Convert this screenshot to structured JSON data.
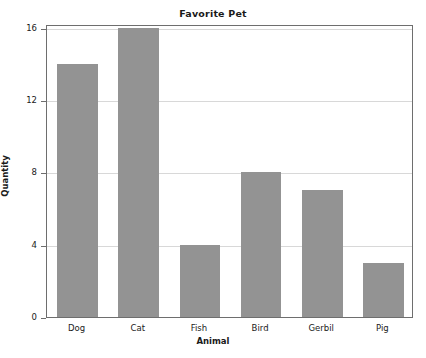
{
  "chart_data": {
    "type": "bar",
    "title": "Favorite Pet",
    "xlabel": "Animal",
    "ylabel": "Quantity",
    "categories": [
      "Dog",
      "Cat",
      "Fish",
      "Bird",
      "Gerbil",
      "Pig"
    ],
    "values": [
      14,
      16,
      4,
      8,
      7,
      3
    ],
    "ylim": [
      0,
      16.2
    ],
    "yticks": [
      0,
      4,
      8,
      12,
      16
    ],
    "ytick_labels": [
      "0",
      "4",
      "8",
      "12",
      "16"
    ],
    "grid": true,
    "legend": null,
    "legend_position": "none",
    "colors": {
      "bar_fill": "#939393",
      "plot_background": "#ffffff",
      "frame": "#6e6e6e",
      "gridline": "#d8d8d8",
      "text": "#1a1a1a"
    }
  }
}
